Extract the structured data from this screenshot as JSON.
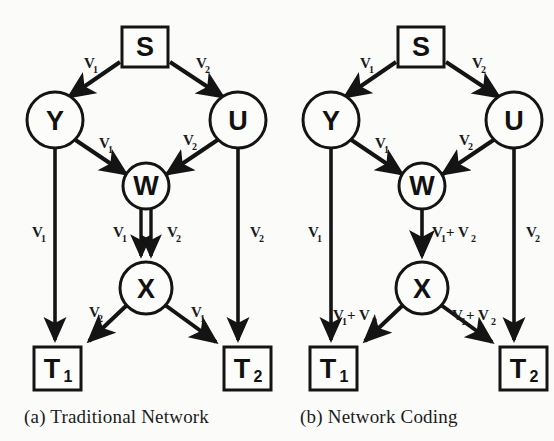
{
  "figure": {
    "background_color": "#fbfbfa",
    "stroke_color": "#141414",
    "panels": [
      {
        "id": "a",
        "caption": "(a) Traditional Network",
        "nodes": [
          {
            "id": "S",
            "shape": "square",
            "label": "S",
            "sub": ""
          },
          {
            "id": "Y",
            "shape": "circle",
            "label": "Y",
            "sub": ""
          },
          {
            "id": "U",
            "shape": "circle",
            "label": "U",
            "sub": ""
          },
          {
            "id": "W",
            "shape": "circle",
            "label": "W",
            "sub": ""
          },
          {
            "id": "X",
            "shape": "circle",
            "label": "X",
            "sub": ""
          },
          {
            "id": "T1",
            "shape": "square",
            "label": "T",
            "sub": "1"
          },
          {
            "id": "T2",
            "shape": "square",
            "label": "T",
            "sub": "2"
          }
        ],
        "edges": [
          {
            "from": "S",
            "to": "Y",
            "label": "V",
            "label_sub": "1",
            "style": "single"
          },
          {
            "from": "S",
            "to": "U",
            "label": "V",
            "label_sub": "2",
            "style": "single"
          },
          {
            "from": "Y",
            "to": "W",
            "label": "V",
            "label_sub": "1",
            "style": "single"
          },
          {
            "from": "U",
            "to": "W",
            "label": "V",
            "label_sub": "2",
            "style": "single"
          },
          {
            "from": "W",
            "to": "X",
            "label": "V",
            "label_sub": "1",
            "style": "double-left"
          },
          {
            "from": "W",
            "to": "X",
            "label": "V",
            "label_sub": "2",
            "style": "double-right"
          },
          {
            "from": "Y",
            "to": "T1",
            "label": "V",
            "label_sub": "1",
            "style": "single"
          },
          {
            "from": "U",
            "to": "T2",
            "label": "V",
            "label_sub": "2",
            "style": "single"
          },
          {
            "from": "X",
            "to": "T1",
            "label": "V",
            "label_sub": "2",
            "style": "single"
          },
          {
            "from": "X",
            "to": "T2",
            "label": "V",
            "label_sub": "1",
            "style": "single"
          }
        ]
      },
      {
        "id": "b",
        "caption": "(b) Network Coding",
        "nodes": [
          {
            "id": "S",
            "shape": "square",
            "label": "S",
            "sub": ""
          },
          {
            "id": "Y",
            "shape": "circle",
            "label": "Y",
            "sub": ""
          },
          {
            "id": "U",
            "shape": "circle",
            "label": "U",
            "sub": ""
          },
          {
            "id": "W",
            "shape": "circle",
            "label": "W",
            "sub": ""
          },
          {
            "id": "X",
            "shape": "circle",
            "label": "X",
            "sub": ""
          },
          {
            "id": "T1",
            "shape": "square",
            "label": "T",
            "sub": "1"
          },
          {
            "id": "T2",
            "shape": "square",
            "label": "T",
            "sub": "2"
          }
        ],
        "edges": [
          {
            "from": "S",
            "to": "Y",
            "label": "V",
            "label_sub": "1",
            "style": "single"
          },
          {
            "from": "S",
            "to": "U",
            "label": "V",
            "label_sub": "2",
            "style": "single"
          },
          {
            "from": "Y",
            "to": "W",
            "label": "V",
            "label_sub": "1",
            "style": "single"
          },
          {
            "from": "U",
            "to": "W",
            "label": "V",
            "label_sub": "2",
            "style": "single"
          },
          {
            "from": "W",
            "to": "X",
            "label": "V",
            "label_sub": "1",
            "label2": "+ V",
            "label2_sub": "2",
            "style": "single"
          },
          {
            "from": "Y",
            "to": "T1",
            "label": "V",
            "label_sub": "1",
            "style": "single"
          },
          {
            "from": "U",
            "to": "T2",
            "label": "V",
            "label_sub": "2",
            "style": "single"
          },
          {
            "from": "X",
            "to": "T1",
            "label": "V",
            "label_sub": "1",
            "label2": "+ V",
            "label2_sub": "2",
            "style": "single"
          },
          {
            "from": "X",
            "to": "T2",
            "label": "V",
            "label_sub": "1",
            "label2": "+ V",
            "label2_sub": "2",
            "style": "single"
          }
        ]
      }
    ]
  },
  "panel_a": {
    "caption": "(a) Traditional Network",
    "node_s": "S",
    "node_y": "Y",
    "node_u": "U",
    "node_w": "W",
    "node_x": "X",
    "node_t1": "T",
    "node_t1_sub": "1",
    "node_t2": "T",
    "node_t2_sub": "2",
    "lbl_s_y": "V",
    "lbl_s_y_sub": "1",
    "lbl_s_u": "V",
    "lbl_s_u_sub": "2",
    "lbl_y_w": "V",
    "lbl_y_w_sub": "1",
    "lbl_u_w": "V",
    "lbl_u_w_sub": "2",
    "lbl_w_x_left": "V",
    "lbl_w_x_left_sub": "1",
    "lbl_w_x_right": "V",
    "lbl_w_x_right_sub": "2",
    "lbl_y_t1": "V",
    "lbl_y_t1_sub": "1",
    "lbl_u_t2": "V",
    "lbl_u_t2_sub": "2",
    "lbl_x_t1": "V",
    "lbl_x_t1_sub": "2",
    "lbl_x_t2": "V",
    "lbl_x_t2_sub": "1"
  },
  "panel_b": {
    "caption": "(b) Network Coding",
    "node_s": "S",
    "node_y": "Y",
    "node_u": "U",
    "node_w": "W",
    "node_x": "X",
    "node_t1": "T",
    "node_t1_sub": "1",
    "node_t2": "T",
    "node_t2_sub": "2",
    "lbl_s_y": "V",
    "lbl_s_y_sub": "1",
    "lbl_s_u": "V",
    "lbl_s_u_sub": "2",
    "lbl_y_w": "V",
    "lbl_y_w_sub": "1",
    "lbl_u_w": "V",
    "lbl_u_w_sub": "2",
    "lbl_w_x_a": "V",
    "lbl_w_x_a_sub": "1",
    "lbl_w_x_b": "+ V",
    "lbl_w_x_b_sub": "2",
    "lbl_y_t1": "V",
    "lbl_y_t1_sub": "1",
    "lbl_u_t2": "V",
    "lbl_u_t2_sub": "2",
    "lbl_x_t1_a": "V",
    "lbl_x_t1_a_sub": "1",
    "lbl_x_t1_b": "+ V",
    "lbl_x_t1_b_sub": "2",
    "lbl_x_t2_a": "V",
    "lbl_x_t2_a_sub": "1",
    "lbl_x_t2_b": "+ V",
    "lbl_x_t2_b_sub": "2"
  }
}
